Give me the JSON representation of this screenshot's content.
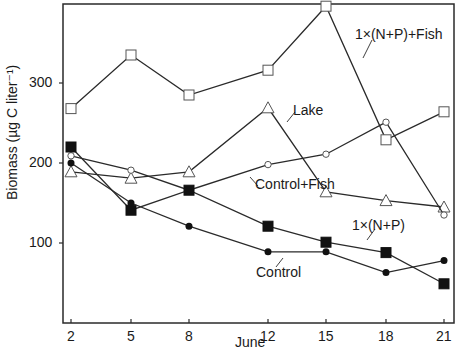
{
  "chart_data": {
    "type": "line",
    "title": "",
    "xlabel": "June",
    "ylabel": "Biomass (µg C liter⁻¹)",
    "x": [
      2,
      5,
      8,
      12,
      15,
      18,
      21
    ],
    "xticks": [
      "2",
      "5",
      "8",
      "12",
      "15",
      "18",
      "21"
    ],
    "yticks": [
      "100",
      "200",
      "300"
    ],
    "ylim": [
      0,
      400
    ],
    "grid": false,
    "legend": "inline annotations",
    "series": [
      {
        "name": "1x(N+P)+Fish",
        "marker": "open-square",
        "values": [
          268,
          335,
          285,
          316,
          396,
          229,
          264
        ]
      },
      {
        "name": "Lake",
        "marker": "open-triangle",
        "values": [
          189,
          181,
          189,
          269,
          164,
          153,
          145
        ]
      },
      {
        "name": "Control+Fish",
        "marker": "open-circle",
        "values": [
          209,
          191,
          166,
          198,
          211,
          251,
          135
        ]
      },
      {
        "name": "1x(N+P)",
        "marker": "filled-square",
        "values": [
          220,
          141,
          166,
          121,
          101,
          88,
          49
        ]
      },
      {
        "name": "Control",
        "marker": "filled-circle",
        "values": [
          200,
          150,
          121,
          89,
          89,
          63,
          78
        ]
      }
    ]
  },
  "annotations": {
    "fish_np": "1×(N+P)+Fish",
    "lake": "Lake",
    "control_fish": "Control+Fish",
    "np": "1×(N+P)",
    "control": "Control"
  },
  "axis": {
    "xlabel": "June",
    "ylabel": "Biomass  (µg C liter⁻¹)"
  }
}
